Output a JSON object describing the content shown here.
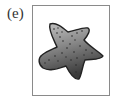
{
  "panel": {
    "label": "(e)",
    "figure": {
      "subject": "starfish",
      "icon": "starfish-icon",
      "colors": {
        "frame_border": "#8a8a8a",
        "body_light": "#bdbdbd",
        "body_dark": "#3c3c3c",
        "outline": "#222222",
        "dots": "#2a2a2a"
      }
    }
  }
}
